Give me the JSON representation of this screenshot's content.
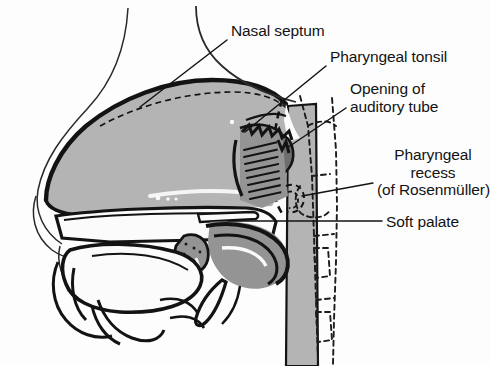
{
  "figure": {
    "kind": "anatomical-illustration",
    "title_partial": "Nasopharynx",
    "background_color": "#fdfdfd",
    "ink_color": "#131313",
    "tints": {
      "light_gray": "#b4b4b4",
      "mid_gray": "#949494",
      "dark_gray": "#6e6e6e",
      "white": "#fbfbfb"
    }
  },
  "labels": [
    {
      "id": "nasal-septum",
      "text": "Nasal septum",
      "x": 231,
      "y": 22,
      "align": "left",
      "leader": {
        "x1": 227,
        "y1": 40,
        "x2": 140,
        "y2": 107
      }
    },
    {
      "id": "pharyngeal-tonsil",
      "text": "Pharyngeal tonsil",
      "x": 330,
      "y": 48,
      "align": "left",
      "leader": {
        "x1": 326,
        "y1": 66,
        "x2": 245,
        "y2": 132
      }
    },
    {
      "id": "opening-of-auditory-tube",
      "text": "Opening of\nauditory tube",
      "x": 350,
      "y": 80,
      "align": "left",
      "leader": {
        "x1": 346,
        "y1": 108,
        "x2": 287,
        "y2": 148
      }
    },
    {
      "id": "pharyngeal-recess",
      "text": "Pharyngeal\nrecess\n(of Rosenmüller)",
      "x": 377,
      "y": 146,
      "align": "left",
      "leader": {
        "x1": 373,
        "y1": 183,
        "x2": 302,
        "y2": 196
      }
    },
    {
      "id": "soft-palate",
      "text": "Soft palate",
      "x": 386,
      "y": 213,
      "align": "left",
      "leader": {
        "x1": 382,
        "y1": 221,
        "x2": 228,
        "y2": 221
      }
    }
  ],
  "structures": [
    {
      "id": "nasal-cavity",
      "name": "Nasal cavity"
    },
    {
      "id": "nasal-septum-body",
      "name": "Nasal septum"
    },
    {
      "id": "nose-profile",
      "name": "External nose profile"
    },
    {
      "id": "pharyngeal-tonsil-body",
      "name": "Pharyngeal tonsil (adenoid)"
    },
    {
      "id": "auditory-tube-opening",
      "name": "Opening of auditory tube"
    },
    {
      "id": "torus-tubarius",
      "name": "Torus tubarius"
    },
    {
      "id": "pharyngeal-recess-body",
      "name": "Pharyngeal recess"
    },
    {
      "id": "soft-palate-body",
      "name": "Soft palate"
    },
    {
      "id": "uvula",
      "name": "Uvula"
    },
    {
      "id": "hard-palate",
      "name": "Hard palate"
    },
    {
      "id": "tongue",
      "name": "Tongue"
    },
    {
      "id": "mandible",
      "name": "Mandible"
    },
    {
      "id": "posterior-pharyngeal-wall",
      "name": "Posterior pharyngeal wall"
    },
    {
      "id": "cervical-vertebrae",
      "name": "Cervical vertebrae (dashed)"
    },
    {
      "id": "sphenoid-sinus",
      "name": "Sphenoid sinus"
    }
  ]
}
